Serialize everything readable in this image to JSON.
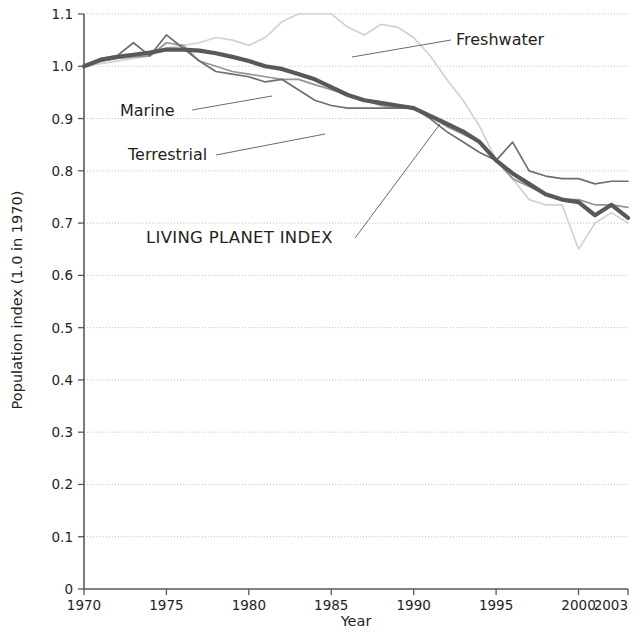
{
  "chart_data": {
    "type": "line",
    "title": "",
    "xlabel": "Year",
    "ylabel": "Population index (1.0 in 1970)",
    "xlim": [
      1970,
      2003
    ],
    "ylim": [
      0,
      1.1
    ],
    "grid": true,
    "legend_position": "inline-annotations",
    "x_ticks": [
      "1970",
      "1975",
      "1980",
      "1985",
      "1990",
      "1995",
      "2000",
      "2003"
    ],
    "x_tick_values": [
      1970,
      1975,
      1980,
      1985,
      1990,
      1995,
      2000,
      2003
    ],
    "y_ticks": [
      "0",
      "0.1",
      "0.2",
      "0.3",
      "0.4",
      "0.5",
      "0.6",
      "0.7",
      "0.8",
      "0.9",
      "1.0",
      "1.1"
    ],
    "y_tick_values": [
      0,
      0.1,
      0.2,
      0.3,
      0.4,
      0.5,
      0.6,
      0.7,
      0.8,
      0.9,
      1.0,
      1.1
    ],
    "x": [
      1970,
      1971,
      1972,
      1973,
      1974,
      1975,
      1976,
      1977,
      1978,
      1979,
      1980,
      1981,
      1982,
      1983,
      1984,
      1985,
      1986,
      1987,
      1988,
      1989,
      1990,
      1991,
      1992,
      1993,
      1994,
      1995,
      1996,
      1997,
      1998,
      1999,
      2000,
      2001,
      2002,
      2003
    ],
    "series": [
      {
        "name": "Freshwater",
        "color": "#d0d2d3",
        "width": 1.7,
        "values": [
          1.0,
          1.005,
          1.01,
          1.015,
          1.02,
          1.035,
          1.04,
          1.045,
          1.055,
          1.05,
          1.04,
          1.055,
          1.085,
          1.1,
          1.1,
          1.1,
          1.075,
          1.06,
          1.08,
          1.075,
          1.055,
          1.02,
          0.975,
          0.935,
          0.885,
          0.82,
          0.785,
          0.745,
          0.735,
          0.735,
          0.65,
          0.7,
          0.72,
          0.7
        ]
      },
      {
        "name": "Marine",
        "color": "#939598",
        "width": 1.7,
        "values": [
          1.0,
          1.01,
          1.015,
          1.018,
          1.02,
          1.045,
          1.04,
          1.01,
          1.0,
          0.99,
          0.985,
          0.98,
          0.975,
          0.975,
          0.965,
          0.955,
          0.945,
          0.935,
          0.925,
          0.92,
          0.92,
          0.905,
          0.885,
          0.87,
          0.855,
          0.82,
          0.785,
          0.77,
          0.755,
          0.745,
          0.745,
          0.735,
          0.735,
          0.73
        ]
      },
      {
        "name": "Terrestrial",
        "color": "#6d6e71",
        "width": 1.7,
        "values": [
          1.0,
          1.015,
          1.02,
          1.045,
          1.02,
          1.06,
          1.035,
          1.01,
          0.99,
          0.985,
          0.98,
          0.97,
          0.975,
          0.955,
          0.935,
          0.925,
          0.92,
          0.92,
          0.92,
          0.92,
          0.92,
          0.9,
          0.875,
          0.855,
          0.835,
          0.82,
          0.855,
          0.8,
          0.79,
          0.785,
          0.785,
          0.775,
          0.78,
          0.78
        ]
      },
      {
        "name": "LIVING PLANET INDEX",
        "color": "#58595b",
        "width": 4.2,
        "values": [
          1.0,
          1.012,
          1.018,
          1.022,
          1.026,
          1.032,
          1.032,
          1.03,
          1.025,
          1.018,
          1.01,
          1.0,
          0.995,
          0.985,
          0.975,
          0.96,
          0.945,
          0.935,
          0.93,
          0.925,
          0.92,
          0.905,
          0.89,
          0.875,
          0.855,
          0.82,
          0.795,
          0.775,
          0.755,
          0.745,
          0.74,
          0.715,
          0.735,
          0.71
        ]
      }
    ],
    "annotations": [
      {
        "id": "freshwater",
        "label": "Freshwater",
        "label_x": 456,
        "label_y": 45,
        "leader": [
          [
            451,
            40
          ],
          [
            352,
            57
          ]
        ]
      },
      {
        "id": "marine",
        "label": "Marine",
        "label_x": 120,
        "label_y": 116,
        "leader": [
          [
            192,
            110
          ],
          [
            272,
            96
          ]
        ]
      },
      {
        "id": "terrestrial",
        "label": "Terrestrial",
        "label_x": 128,
        "label_y": 160,
        "leader": [
          [
            216,
            155
          ],
          [
            325,
            134
          ]
        ]
      },
      {
        "id": "living-planet-index",
        "label": "LIVING PLANET INDEX",
        "label_x": 146,
        "label_y": 243,
        "leader": [
          [
            355,
            238
          ],
          [
            440,
            124
          ]
        ]
      }
    ]
  }
}
